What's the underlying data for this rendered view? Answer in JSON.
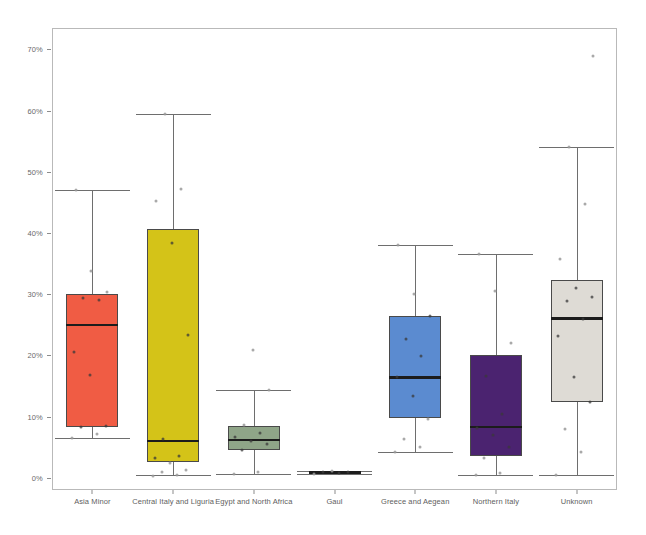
{
  "chart_data": {
    "type": "box",
    "title": "",
    "xlabel": "",
    "ylabel": "",
    "ylim": [
      -0.02,
      0.735
    ],
    "y_tick_labels": [
      "0%",
      "10%",
      "20%",
      "30%",
      "40%",
      "50%",
      "60%",
      "70%"
    ],
    "y_tick_values": [
      0,
      10,
      20,
      30,
      40,
      50,
      60,
      70
    ],
    "y_unit": "%",
    "grid": false,
    "legend": "none",
    "categories": [
      "Asia Minor",
      "Central Italy and Liguria",
      "Egypt and North Africa",
      "Gaul",
      "Greece and Aegean",
      "Northern Italy",
      "Unknown"
    ],
    "box_colors": [
      "#F05C44",
      "#D4C318",
      "#8FA588",
      "#1f1f1f",
      "#5B8BD0",
      "#4B2370",
      "#DEDBD5"
    ],
    "boxes": [
      {
        "category": "Asia Minor",
        "color": "#F05C44",
        "whisker_low": 6.5,
        "q1": 8.3,
        "median": 25.0,
        "q3": 30.1,
        "whisker_high": 47.0,
        "points": [
          6.5,
          7.2,
          8.3,
          8.4,
          16.8,
          20.5,
          29.0,
          29.3,
          30.3,
          33.8,
          47.0
        ]
      },
      {
        "category": "Central Italy and Liguria",
        "color": "#D4C318",
        "whisker_low": 0.4,
        "q1": 2.5,
        "median": 6.0,
        "q3": 40.6,
        "whisker_high": 59.5,
        "points": [
          0.3,
          0.5,
          0.9,
          1.3,
          2.4,
          3.3,
          3.6,
          6.3,
          23.4,
          38.3,
          45.2,
          47.2,
          59.5
        ]
      },
      {
        "category": "Egypt and North Africa",
        "color": "#8FA588",
        "whisker_low": 0.6,
        "q1": 4.6,
        "median": 6.2,
        "q3": 8.5,
        "whisker_high": 14.3,
        "points": [
          0.6,
          0.9,
          4.6,
          5.5,
          6.0,
          6.6,
          7.3,
          8.6,
          14.3,
          20.8
        ]
      },
      {
        "category": "Gaul",
        "color": "#1f1f1f",
        "whisker_low": 0.6,
        "q1": 0.7,
        "median": 0.9,
        "q3": 1.0,
        "whisker_high": 1.1,
        "points": [
          0.6,
          0.8,
          0.9,
          1.0,
          1.1
        ]
      },
      {
        "category": "Greece and Aegean",
        "color": "#5B8BD0",
        "whisker_low": 4.2,
        "q1": 9.7,
        "median": 16.4,
        "q3": 26.4,
        "whisker_high": 38.0,
        "points": [
          4.2,
          5.1,
          6.3,
          9.6,
          13.4,
          16.4,
          19.9,
          22.6,
          26.4,
          30.0,
          38.0
        ]
      },
      {
        "category": "Northern Italy",
        "color": "#4B2370",
        "whisker_low": 0.5,
        "q1": 3.6,
        "median": 8.3,
        "q3": 20.0,
        "whisker_high": 36.5,
        "points": [
          0.5,
          0.8,
          3.2,
          5.1,
          7.0,
          8.2,
          10.4,
          16.7,
          22.1,
          30.5,
          36.5
        ]
      },
      {
        "category": "Unknown",
        "color": "#DEDBD5",
        "whisker_low": 0.4,
        "q1": 12.3,
        "median": 26.0,
        "q3": 32.3,
        "whisker_high": 54.0,
        "points": [
          0.4,
          4.2,
          8.0,
          12.3,
          16.5,
          23.2,
          26.0,
          28.9,
          29.5,
          31.0,
          35.8,
          44.8,
          54.0,
          69.0
        ]
      }
    ]
  }
}
